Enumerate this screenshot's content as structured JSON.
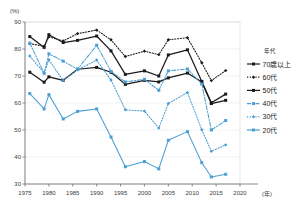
{
  "chart_data": {
    "type": "line",
    "title": "",
    "xlabel": "(年)",
    "ylabel": "(%)",
    "xlim": [
      1975,
      2020
    ],
    "ylim": [
      30,
      90
    ],
    "xticks": [
      1975,
      1980,
      1985,
      1990,
      1995,
      2000,
      2005,
      2010,
      2015,
      2020
    ],
    "yticks": [
      30,
      40,
      50,
      60,
      70,
      80,
      90
    ],
    "grid": true,
    "legend_position": "right",
    "legend_title": "年代",
    "x": [
      1976,
      1979,
      1980,
      1983,
      1986,
      1990,
      1993,
      1996,
      2000,
      2003,
      2005,
      2009,
      2012,
      2014,
      2017
    ],
    "series": [
      {
        "name": "70歳以上",
        "color": "#1a1a1a",
        "dash": "solid",
        "marker": "square",
        "values": [
          71.4,
          67.7,
          69.7,
          68.4,
          72.5,
          73.2,
          71.4,
          66.9,
          68.4,
          67.8,
          69.3,
          71.1,
          67.8,
          59.8,
          61.0
        ]
      },
      {
        "name": "60代",
        "color": "#1a1a1a",
        "dash": "dotted",
        "marker": "diamond",
        "values": [
          82.0,
          81.0,
          84.5,
          83.0,
          85.7,
          87.0,
          83.4,
          77.2,
          79.2,
          77.9,
          83.4,
          84.2,
          74.9,
          68.3,
          72.0
        ]
      },
      {
        "name": "50代",
        "color": "#1a1a1a",
        "dash": "solid",
        "marker": "square",
        "values": [
          84.6,
          80.6,
          85.3,
          82.4,
          83.2,
          84.8,
          79.3,
          70.6,
          71.9,
          70.0,
          77.8,
          79.7,
          68.0,
          60.1,
          63.3
        ]
      },
      {
        "name": "40代",
        "color": "#4a9fd4",
        "dash": "dashdot",
        "marker": "square",
        "values": [
          82.2,
          71.0,
          78.2,
          75.5,
          72.5,
          81.4,
          71.7,
          67.8,
          68.8,
          64.7,
          71.9,
          72.6,
          67.0,
          50.0,
          53.5
        ]
      },
      {
        "name": "30代",
        "color": "#4a9fd4",
        "dash": "dotted",
        "marker": "diamond",
        "values": [
          77.4,
          71.1,
          76.0,
          68.3,
          72.3,
          75.9,
          68.5,
          57.5,
          57.0,
          50.7,
          59.8,
          63.9,
          50.1,
          42.1,
          44.5
        ]
      },
      {
        "name": "20代",
        "color": "#4a9fd4",
        "dash": "solid",
        "marker": "square",
        "values": [
          63.5,
          57.8,
          63.1,
          54.1,
          56.9,
          57.8,
          47.4,
          36.4,
          38.3,
          35.6,
          46.2,
          49.4,
          37.9,
          32.6,
          33.6
        ]
      }
    ]
  },
  "legend": {
    "title": "年代",
    "items": [
      {
        "label": "70歳以上"
      },
      {
        "label": "60代"
      },
      {
        "label": "50代"
      },
      {
        "label": "40代"
      },
      {
        "label": "30代"
      },
      {
        "label": "20代"
      }
    ]
  },
  "axes": {
    "y_unit": "(%)",
    "x_unit": "(年)",
    "y_tick_labels": [
      "90",
      "80",
      "70",
      "60",
      "50",
      "40",
      "30"
    ],
    "x_tick_labels": [
      "1975",
      "1980",
      "1985",
      "1990",
      "1995",
      "2000",
      "2005",
      "2010",
      "2015",
      "2020"
    ]
  }
}
